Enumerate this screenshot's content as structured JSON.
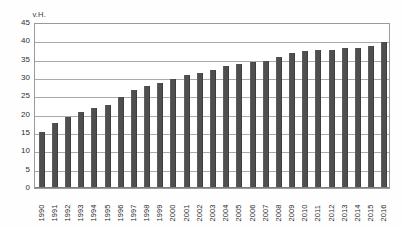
{
  "chart_data": {
    "type": "bar",
    "title": "",
    "xlabel": "",
    "ylabel": "v.H.",
    "ylim": [
      0,
      45
    ],
    "ytick_step": 5,
    "yticks": [
      45,
      40,
      35,
      30,
      25,
      20,
      15,
      10,
      5,
      0
    ],
    "grid": true,
    "legend": "none",
    "bar_color": "#4f4f4f",
    "categories": [
      "1990",
      "1991",
      "1992",
      "1993",
      "1994",
      "1995",
      "1996",
      "1997",
      "1998",
      "1999",
      "2000",
      "2001",
      "2002",
      "2003",
      "2004",
      "2005",
      "2006",
      "2007",
      "2008",
      "2009",
      "2010",
      "2011",
      "2012",
      "2013",
      "2014",
      "2015",
      "2016"
    ],
    "values": [
      15.0,
      17.5,
      19.0,
      20.5,
      21.5,
      22.5,
      24.5,
      26.5,
      27.5,
      28.5,
      29.5,
      30.5,
      31.0,
      32.0,
      33.0,
      33.5,
      34.0,
      34.5,
      35.5,
      36.5,
      37.0,
      37.5,
      37.5,
      38.0,
      38.0,
      38.5,
      39.5
    ]
  }
}
